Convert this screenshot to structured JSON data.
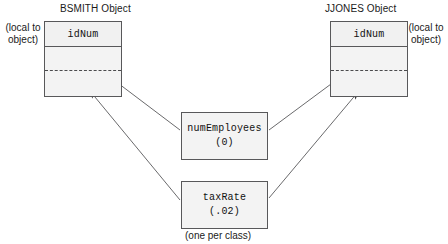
{
  "diagram": {
    "title_bsmith": "BSMITH Object",
    "title_jjones": "JJONES Object",
    "note_left": "(local to\nobject)",
    "note_left_line1": "(local to",
    "note_left_line2": "object)",
    "note_right_line1": "(local to",
    "note_right_line2": "object)",
    "note_bottom": "(one per class)",
    "object_field": "idNum",
    "class_vars": [
      {
        "name": "numEmployees",
        "value": "(0)"
      },
      {
        "name": "taxRate",
        "value": "(.02)"
      }
    ],
    "colors": {
      "stroke": "#58585a",
      "box_fill": "#f3f3f3",
      "text": "#111111",
      "arrow": "#5a5a5c",
      "dash": "#4b4b4d"
    }
  }
}
